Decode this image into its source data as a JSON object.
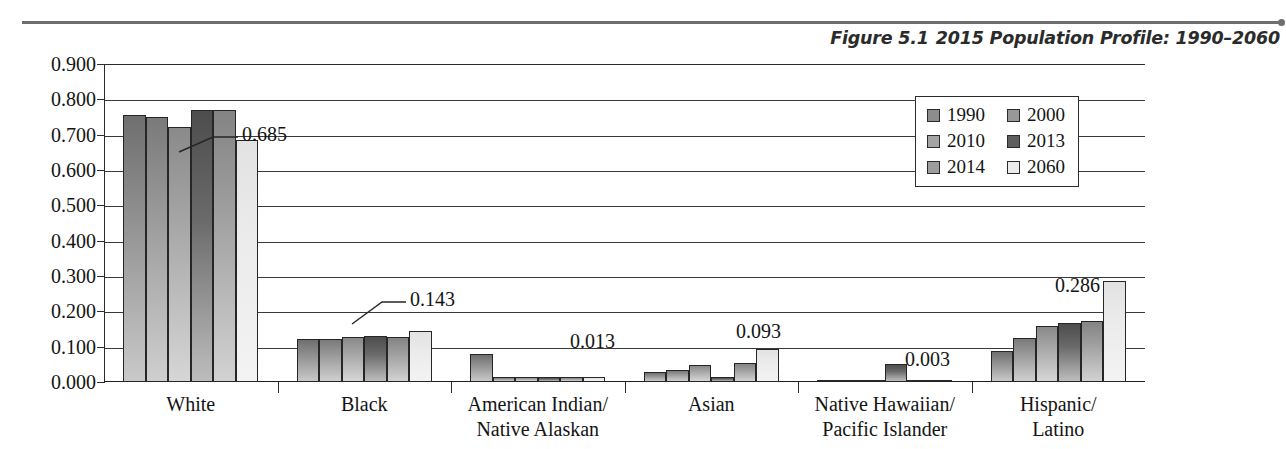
{
  "figure": {
    "number": "Figure 5.1",
    "title": "2015 Population Profile: 1990–2060"
  },
  "chart_data": {
    "type": "bar",
    "title": "2015 Population Profile: 1990–2060",
    "xlabel": "",
    "ylabel": "",
    "ylim": [
      0.0,
      0.9
    ],
    "grid": true,
    "legend_position": "top-right",
    "ytick_labels": [
      "0.900",
      "0.800",
      "0.700",
      "0.600",
      "0.500",
      "0.400",
      "0.300",
      "0.200",
      "0.100",
      "0.000"
    ],
    "ytick_values": [
      0.9,
      0.8,
      0.7,
      0.6,
      0.5,
      0.4,
      0.3,
      0.2,
      0.1,
      0.0
    ],
    "categories": [
      "White",
      "Black",
      "American Indian/\nNative Alaskan",
      "Asian",
      "Native Hawaiian/\nPacific Islander",
      "Hispanic/\nLatino"
    ],
    "category_lines": [
      [
        "White"
      ],
      [
        "Black"
      ],
      [
        "American Indian/",
        "Native Alaskan"
      ],
      [
        "Asian"
      ],
      [
        "Native Hawaiian/",
        "Pacific Islander"
      ],
      [
        "Hispanic/",
        "Latino"
      ]
    ],
    "series": [
      {
        "name": "1990",
        "values": [
          0.756,
          0.121,
          0.079,
          0.029,
          0.007,
          0.088
        ]
      },
      {
        "name": "2000",
        "values": [
          0.75,
          0.122,
          0.013,
          0.035,
          0.006,
          0.125
        ]
      },
      {
        "name": "2010",
        "values": [
          0.722,
          0.126,
          0.014,
          0.048,
          0.006,
          0.159
        ]
      },
      {
        "name": "2013",
        "values": [
          0.77,
          0.129,
          0.013,
          0.013,
          0.051,
          0.168
        ]
      },
      {
        "name": "2014",
        "values": [
          0.769,
          0.128,
          0.015,
          0.053,
          0.006,
          0.172
        ]
      },
      {
        "name": "2060",
        "values": [
          0.685,
          0.143,
          0.013,
          0.093,
          0.003,
          0.286
        ]
      }
    ],
    "annotations": [
      {
        "text": "0.685",
        "category": "White",
        "series": "2060",
        "value": 0.685
      },
      {
        "text": "0.143",
        "category": "Black",
        "series": "2060",
        "value": 0.143
      },
      {
        "text": "0.013",
        "category": "American Indian/Native Alaskan",
        "series": "2060",
        "value": 0.013
      },
      {
        "text": "0.093",
        "category": "Asian",
        "series": "2060",
        "value": 0.093
      },
      {
        "text": "0.003",
        "category": "Native Hawaiian/Pacific Islander",
        "series": "2060",
        "value": 0.003
      },
      {
        "text": "0.286",
        "category": "Hispanic/Latino",
        "series": "2060",
        "value": 0.286
      }
    ]
  },
  "legend": {
    "items": [
      {
        "label": "1990",
        "color": "#8d8d8d"
      },
      {
        "label": "2000",
        "color": "#989898"
      },
      {
        "label": "2010",
        "color": "#a4a4a4"
      },
      {
        "label": "2013",
        "color": "#5f5f5f"
      },
      {
        "label": "2014",
        "color": "#9d9d9d"
      },
      {
        "label": "2060",
        "color": "#ececec"
      }
    ]
  }
}
